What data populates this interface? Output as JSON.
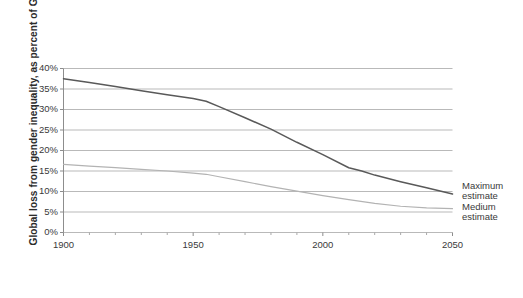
{
  "chart_data": {
    "type": "line",
    "title": "",
    "xlabel": "",
    "ylabel": "Global loss from gender inequality, as percent of GDP",
    "xlim": [
      1900,
      2050
    ],
    "ylim": [
      0,
      40
    ],
    "xticks": [
      1900,
      1950,
      2000,
      2050
    ],
    "xticklabels": [
      "1900",
      "1950",
      "2000",
      "2050"
    ],
    "yticks": [
      0,
      5,
      10,
      15,
      20,
      25,
      30,
      35,
      40
    ],
    "yticklabels": [
      "0%",
      "5%",
      "10%",
      "15%",
      "20%",
      "25%",
      "30%",
      "35%",
      "40%"
    ],
    "grid": "horizontal",
    "legend_position": "right-inline",
    "series": [
      {
        "name": "Maximum estimate",
        "color": "#595959",
        "x": [
          1900,
          1910,
          1920,
          1930,
          1940,
          1950,
          1955,
          1960,
          1970,
          1980,
          1990,
          2000,
          2010,
          2015,
          2020,
          2030,
          2040,
          2050
        ],
        "values": [
          37.5,
          36.6,
          35.6,
          34.6,
          33.6,
          32.7,
          32.0,
          30.7,
          28.0,
          25.2,
          22.0,
          19.0,
          15.8,
          15.0,
          14.0,
          12.4,
          10.9,
          9.4
        ]
      },
      {
        "name": "Medium estimate",
        "color": "#b3b3b3",
        "x": [
          1900,
          1910,
          1920,
          1930,
          1940,
          1950,
          1955,
          1960,
          1970,
          1980,
          1990,
          2000,
          2010,
          2020,
          2030,
          2040,
          2050
        ],
        "values": [
          16.6,
          16.2,
          15.8,
          15.4,
          15.0,
          14.5,
          14.2,
          13.6,
          12.4,
          11.2,
          10.1,
          9.0,
          8.0,
          7.1,
          6.4,
          6.0,
          5.8
        ]
      }
    ]
  },
  "axis": {
    "y_title": "Global loss from gender inequality, as percent of GDP"
  },
  "legend": {
    "items": [
      {
        "line1": "Maximum",
        "line2": "estimate"
      },
      {
        "line1": "Medium",
        "line2": "estimate"
      }
    ]
  }
}
